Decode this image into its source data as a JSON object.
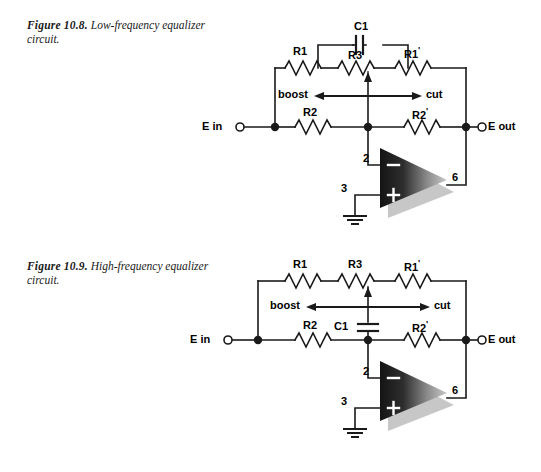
{
  "figures": [
    {
      "id": "fig-10-8",
      "number": "Figure 10.8.",
      "description": "Low-frequency equalizer circuit.",
      "components": {
        "r1": "R1",
        "r1_prime": "R1",
        "r2": "R2",
        "r2_prime": "R2",
        "r3": "R3",
        "c1": "C1",
        "prime_mark": "'"
      },
      "terminals": {
        "input": "E in",
        "output": "E out"
      },
      "control": {
        "left": "boost",
        "right": "cut"
      },
      "opamp_pins": {
        "inverting": "2",
        "noninverting": "3",
        "output": "6",
        "minus": "−",
        "plus": "+"
      }
    },
    {
      "id": "fig-10-9",
      "number": "Figure 10.9.",
      "description": "High-frequency equalizer circuit.",
      "components": {
        "r1": "R1",
        "r1_prime": "R1",
        "r2": "R2",
        "r2_prime": "R2",
        "r3": "R3",
        "c1": "C1",
        "prime_mark": "'"
      },
      "terminals": {
        "input": "E in",
        "output": "E out"
      },
      "control": {
        "left": "boost",
        "right": "cut"
      },
      "opamp_pins": {
        "inverting": "2",
        "noninverting": "3",
        "output": "6",
        "minus": "−",
        "plus": "+"
      }
    }
  ],
  "colors": {
    "background": "#ffffff",
    "wire": "#1a1a1a",
    "text": "#000000",
    "opamp_dark": "#1c1c1c",
    "opamp_light": "#b4b4b4",
    "shadow": "#b9b9b9"
  }
}
